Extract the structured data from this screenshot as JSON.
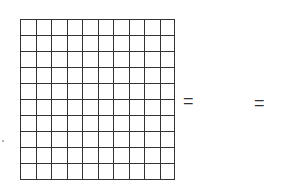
{
  "diagram": {
    "grid": {
      "rows": 10,
      "cols": 10,
      "line_color": "#333333"
    },
    "equals_1": "=",
    "equals_2": "="
  }
}
